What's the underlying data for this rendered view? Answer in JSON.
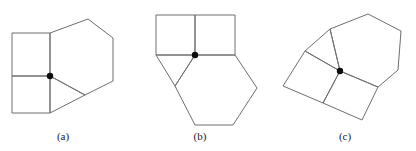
{
  "figure": {
    "background_color": "#ffffff",
    "stroke_color": "#6e6e6e",
    "dot_color": "#0d0d0d",
    "stroke_width": 1,
    "dot_radius": 3.2,
    "canvas": {
      "width": 416,
      "height": 151
    },
    "captions": [
      {
        "id": "a",
        "label": "(a)",
        "x": 63,
        "y": 138
      },
      {
        "id": "b",
        "label": "(b)",
        "x": 200,
        "y": 138
      },
      {
        "id": "c",
        "label": "(c)",
        "x": 345,
        "y": 138
      }
    ],
    "panels": [
      {
        "id": "a",
        "caption": "(a)",
        "vertex_dot": {
          "x": 50,
          "y": 76
        },
        "shapes": [
          {
            "name": "square-upper-left",
            "type": "square",
            "points": "12,33 50,33 50,76 12,76"
          },
          {
            "name": "square-lower-left",
            "type": "square",
            "points": "12,76 50,76 50,113 12,113"
          },
          {
            "name": "hexagon-right",
            "type": "hexagon",
            "points": "50,33 88,19 113,38 113,81 85,95 50,76"
          },
          {
            "name": "triangle-lower",
            "type": "triangle",
            "points": "50,76 85,95 50,113"
          }
        ]
      },
      {
        "id": "b",
        "caption": "(b)",
        "vertex_dot": {
          "x": 195,
          "y": 55
        },
        "shapes": [
          {
            "name": "square-upper-left",
            "type": "square",
            "points": "156,15 195,15 195,55 156,55"
          },
          {
            "name": "square-upper-right",
            "type": "square",
            "points": "195,15 235,15 235,55 195,55"
          },
          {
            "name": "hexagon-lower",
            "type": "hexagon",
            "points": "195,55 235,55 257,88 233,125 195,125 175,86"
          },
          {
            "name": "triangle-left",
            "type": "triangle",
            "points": "156,55 195,55 175,86"
          }
        ]
      },
      {
        "id": "c",
        "caption": "(c)",
        "vertex_dot": {
          "x": 340,
          "y": 71
        },
        "shapes": [
          {
            "name": "square-left",
            "type": "square",
            "points": "305,51 340,71 323,103 283,86"
          },
          {
            "name": "square-right",
            "type": "square",
            "points": "340,71 378,87 362,120 323,103"
          },
          {
            "name": "hexagon-upper-right",
            "type": "hexagon",
            "points": "340,71 330,29 368,14 401,31 398,70 378,87"
          },
          {
            "name": "triangle-upper-left",
            "type": "triangle",
            "points": "305,51 330,29 340,71"
          }
        ]
      }
    ]
  }
}
